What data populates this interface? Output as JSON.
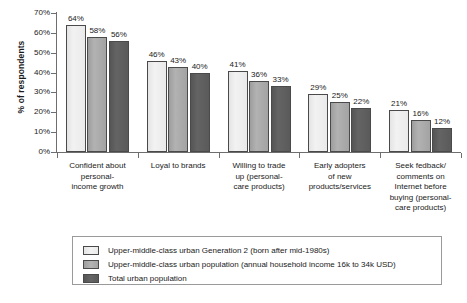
{
  "chart_data": {
    "type": "bar",
    "title": "",
    "xlabel": "",
    "ylabel": "% of respondents",
    "ylim": [
      0,
      70
    ],
    "ytick_labels": [
      "70%",
      "60%",
      "50%",
      "40%",
      "30%",
      "20%",
      "10%",
      "0%"
    ],
    "ytick_values": [
      70,
      60,
      50,
      40,
      30,
      20,
      10,
      0
    ],
    "grid": false,
    "legend_position": "bottom",
    "categories": [
      "Confident about personal-income growth",
      "Loyal to brands",
      "Willing to trade up (personal-care products)",
      "Early adopters of new products/services",
      "Seek fedback/comments on Internet before buying (personal-care products)"
    ],
    "category_lines": [
      [
        "Confident about",
        "personal-",
        "income growth"
      ],
      [
        "Loyal to brands"
      ],
      [
        "Willing to trade",
        "up (personal-",
        "care products)"
      ],
      [
        "Early adopters",
        "of new",
        "products/services"
      ],
      [
        "Seek fedback/",
        "comments on",
        "Internet before",
        "buying (personal-",
        "care products)"
      ]
    ],
    "series": [
      {
        "name": "Upper-middle-class urban Generation 2 (born after mid-1980s)",
        "color": "#eeeeee",
        "values": [
          64,
          46,
          41,
          29,
          21
        ],
        "labels": [
          "64%",
          "46%",
          "41%",
          "29%",
          "21%"
        ]
      },
      {
        "name": "Upper-middle-class urban population (annual household income 16k to 34k USD)",
        "color": "#a8a8a8",
        "values": [
          58,
          43,
          36,
          25,
          16
        ],
        "labels": [
          "58%",
          "43%",
          "36%",
          "25%",
          "16%"
        ]
      },
      {
        "name": "Total urban population",
        "color": "#5c5c5c",
        "values": [
          56,
          40,
          33,
          22,
          12
        ],
        "labels": [
          "56%",
          "40%",
          "33%",
          "22%",
          "12%"
        ]
      }
    ]
  },
  "legend": {
    "entries": [
      "Upper-middle-class urban Generation 2 (born after mid-1980s)",
      "Upper-middle-class urban population (annual household income 16k to 34k USD)",
      "Total urban population"
    ]
  }
}
